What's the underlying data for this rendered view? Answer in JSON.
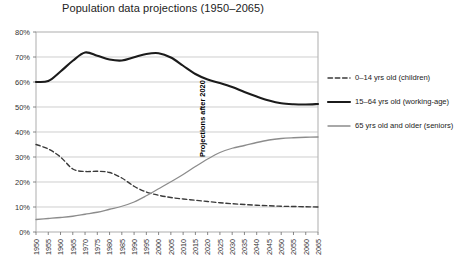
{
  "chart_data": {
    "type": "line",
    "title": "Population data projections (1950–2065)",
    "xlabel": "",
    "ylabel": "",
    "xlim": [
      1950,
      2065
    ],
    "ylim": [
      0,
      80
    ],
    "grid": true,
    "legend_position": "right",
    "ytick_labels": [
      "0%",
      "10%",
      "20%",
      "30%",
      "40%",
      "50%",
      "60%",
      "70%",
      "80%"
    ],
    "ytick_values": [
      0,
      10,
      20,
      30,
      40,
      50,
      60,
      70,
      80
    ],
    "x": [
      1950,
      1955,
      1960,
      1965,
      1970,
      1975,
      1980,
      1985,
      1990,
      1995,
      2000,
      2005,
      2010,
      2015,
      2020,
      2025,
      2030,
      2035,
      2040,
      2045,
      2050,
      2055,
      2060,
      2065
    ],
    "xtick_labels": [
      "1950",
      "1955",
      "1960",
      "1965",
      "1970",
      "1975",
      "1980",
      "1985",
      "1990",
      "1995",
      "2000",
      "2005",
      "2010",
      "2015",
      "2020",
      "2025",
      "2030",
      "2035",
      "2040",
      "2045",
      "2050",
      "2055",
      "2060",
      "2065"
    ],
    "series": [
      {
        "name": "0–14 yrs old (children)",
        "style": "dashed",
        "color": "#3a3a3a",
        "width": 1.4,
        "values": [
          35.0,
          33.2,
          30.0,
          25.2,
          24.2,
          24.3,
          23.8,
          21.6,
          18.3,
          16.0,
          14.7,
          13.8,
          13.2,
          12.7,
          12.2,
          11.7,
          11.3,
          11.0,
          10.7,
          10.5,
          10.3,
          10.2,
          10.1,
          10.0
        ]
      },
      {
        "name": "15–64 yrs old (working-age)",
        "style": "solid",
        "color": "#1b1b1b",
        "width": 2.1,
        "values": [
          60.0,
          60.4,
          64.2,
          68.5,
          71.8,
          70.5,
          69.0,
          68.6,
          69.9,
          71.2,
          71.5,
          69.8,
          66.5,
          63.2,
          61.0,
          59.6,
          58.0,
          56.0,
          54.2,
          52.6,
          51.5,
          51.1,
          51.0,
          51.2
        ]
      },
      {
        "name": "65 yrs old and older (seniors)",
        "style": "solid",
        "color": "#8c8c8c",
        "width": 1.3,
        "values": [
          5.0,
          5.4,
          5.8,
          6.3,
          7.1,
          7.9,
          9.1,
          10.3,
          12.0,
          14.5,
          17.3,
          20.1,
          23.0,
          26.2,
          29.2,
          31.8,
          33.5,
          34.6,
          35.8,
          36.8,
          37.4,
          37.7,
          37.9,
          38.0
        ]
      }
    ],
    "annotations": [
      {
        "text": "Projections after 2020",
        "x": 2020,
        "orientation": "vertical",
        "color": "#000000"
      }
    ]
  },
  "legend": {
    "items": [
      {
        "label": "0–14 yrs old (children)"
      },
      {
        "label": "15–64 yrs old (working-age)"
      },
      {
        "label": "65 yrs old and older (seniors)"
      }
    ]
  }
}
